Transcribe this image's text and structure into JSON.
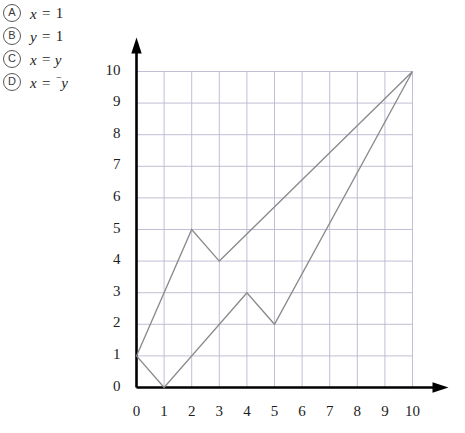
{
  "choices": [
    {
      "bullet": "A",
      "lhs": "x",
      "op": "=",
      "neg": "",
      "rhs": "1"
    },
    {
      "bullet": "B",
      "lhs": "y",
      "op": "=",
      "neg": "",
      "rhs": "1"
    },
    {
      "bullet": "C",
      "lhs": "x",
      "op": "=",
      "neg": "",
      "rhs": "y"
    },
    {
      "bullet": "D",
      "lhs": "x",
      "op": "=",
      "neg": "⁻",
      "rhs": "y"
    }
  ],
  "colors": {
    "axis": "#000000",
    "grid": "#b9b9cf",
    "shape_stroke": "#8a8a8a",
    "text": "#1d1d1d"
  },
  "chart_data": {
    "type": "scatter",
    "title": "",
    "xlabel": "",
    "ylabel": "",
    "xlim": [
      0,
      10
    ],
    "ylim": [
      0,
      10
    ],
    "grid": true,
    "legend": "none",
    "xticks": [
      "0",
      "1",
      "2",
      "3",
      "4",
      "5",
      "6",
      "7",
      "8",
      "9",
      "10"
    ],
    "yticks": [
      "0",
      "1",
      "2",
      "3",
      "4",
      "5",
      "6",
      "7",
      "8",
      "9",
      "10"
    ],
    "series": [
      {
        "name": "polygon",
        "closed": true,
        "points": [
          [
            0,
            1
          ],
          [
            2,
            5
          ],
          [
            3,
            4
          ],
          [
            10,
            10
          ],
          [
            5,
            2
          ],
          [
            4,
            3
          ],
          [
            1,
            0
          ]
        ]
      }
    ]
  }
}
